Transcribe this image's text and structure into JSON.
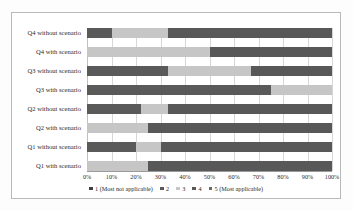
{
  "chart_data": {
    "type": "bar",
    "orientation": "horizontal",
    "stacked": true,
    "normalized": true,
    "title": "",
    "xlabel": "",
    "ylabel": "",
    "xlim": [
      0,
      100
    ],
    "xticks": [
      "0%",
      "10%",
      "20%",
      "30%",
      "40%",
      "50%",
      "60%",
      "70%",
      "80%",
      "90%",
      "100%"
    ],
    "grid": true,
    "legend_position": "bottom",
    "categories": [
      "Q4 without scenario",
      "Q4 with scenario",
      "Q3 without scenario",
      "Q3 with scenario",
      "Q2 without scenario",
      "Q2 with scenario",
      "Q1 without scenario",
      "Q1 with scenario"
    ],
    "series": [
      {
        "name": "1 (Most not applicable)",
        "color": "#3f3f3f",
        "values": [
          0,
          0,
          0,
          0,
          0,
          0,
          0,
          0
        ]
      },
      {
        "name": "2",
        "color": "#5a5a5a",
        "values": [
          10,
          0,
          33,
          75,
          22,
          0,
          20,
          0
        ]
      },
      {
        "name": "3",
        "color": "#c6c6c6",
        "values": [
          23,
          50,
          34,
          25,
          11,
          25,
          10,
          25
        ]
      },
      {
        "name": "4",
        "color": "#585858",
        "values": [
          67,
          50,
          33,
          0,
          67,
          75,
          70,
          75
        ]
      },
      {
        "name": "5 (Most applicable)",
        "color": "#6b6b6b",
        "values": [
          0,
          0,
          0,
          0,
          0,
          0,
          0,
          0
        ]
      }
    ]
  },
  "legend": {
    "items": [
      {
        "label": "1 (Most not applicable)",
        "color": "#3f3f3f"
      },
      {
        "label": "2",
        "color": "#5a5a5a"
      },
      {
        "label": "3",
        "color": "#c6c6c6"
      },
      {
        "label": "4",
        "color": "#585858"
      },
      {
        "label": "5 (Most applicable)",
        "color": "#6b6b6b"
      }
    ]
  }
}
